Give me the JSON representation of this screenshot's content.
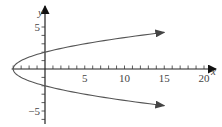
{
  "chart_data": {
    "type": "line",
    "title": "",
    "equation": "x = y^2 - 4",
    "xlabel": "x",
    "ylabel": "y",
    "xlim": [
      -4,
      21
    ],
    "ylim": [
      -7,
      7
    ],
    "x_ticks": [
      -4,
      -3,
      -2,
      -1,
      0,
      1,
      2,
      3,
      4,
      5,
      6,
      7,
      8,
      9,
      10,
      11,
      12,
      13,
      14,
      15,
      16,
      17,
      18,
      19,
      20
    ],
    "x_tick_labels": [
      "5",
      "10",
      "15",
      "20"
    ],
    "x_tick_label_values": [
      5,
      10,
      15,
      20
    ],
    "y_ticks": [
      -6,
      -5,
      -4,
      -3,
      -2,
      -1,
      1,
      2,
      3,
      4,
      5
    ],
    "y_tick_labels": [
      "5",
      "−5"
    ],
    "y_tick_label_values": [
      5,
      -5
    ],
    "grid": false,
    "legend": "none",
    "series": [
      {
        "name": "upper-branch",
        "y_range": [
          0,
          4.36
        ],
        "arrow": "end"
      },
      {
        "name": "lower-branch",
        "y_range": [
          0,
          -4.36
        ],
        "arrow": "end"
      }
    ],
    "curve_color": "#555555",
    "axis_color": "#222222"
  }
}
